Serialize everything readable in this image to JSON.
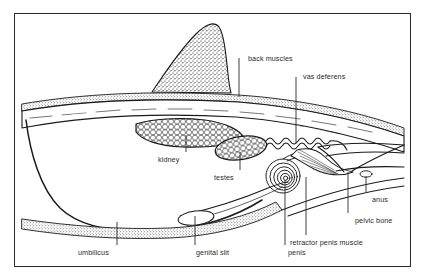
{
  "figure": {
    "background_color": "#ffffff",
    "frame_color": "#2b2b2b",
    "ink_color": "#1a1a1a",
    "label_color": "#2a2a2a"
  },
  "labels": [
    {
      "id": "back-muscles",
      "text": "back muscles",
      "x": 248,
      "y": 55,
      "leader": {
        "x1": 239,
        "y1": 58,
        "x2": 239,
        "y2": 97
      }
    },
    {
      "id": "vas-deferens",
      "text": "vas deferens",
      "x": 303,
      "y": 73,
      "leader": {
        "x1": 296,
        "y1": 77,
        "x2": 296,
        "y2": 143
      }
    },
    {
      "id": "kidney",
      "text": "kidney",
      "x": 158,
      "y": 156,
      "leader": {
        "x1": 186,
        "y1": 135,
        "x2": 186,
        "y2": 152
      }
    },
    {
      "id": "testes",
      "text": "testes",
      "x": 214,
      "y": 174,
      "leader": {
        "x1": 240,
        "y1": 152,
        "x2": 240,
        "y2": 170
      }
    },
    {
      "id": "anus",
      "text": "anus",
      "x": 372,
      "y": 196,
      "leader": {
        "x1": 366,
        "y1": 176,
        "x2": 366,
        "y2": 192
      }
    },
    {
      "id": "pelvic-bone",
      "text": "pelvic bone",
      "x": 355,
      "y": 217,
      "leader": {
        "x1": 348,
        "y1": 172,
        "x2": 348,
        "y2": 213
      }
    },
    {
      "id": "umbilicus",
      "text": "umbilicus",
      "x": 78,
      "y": 249,
      "leader": {
        "x1": 117,
        "y1": 222,
        "x2": 117,
        "y2": 245
      }
    },
    {
      "id": "genital-slit",
      "text": "genital slit",
      "x": 196,
      "y": 249,
      "leader": {
        "x1": 195,
        "y1": 216,
        "x2": 195,
        "y2": 245
      }
    },
    {
      "id": "penis",
      "text": "penis",
      "x": 288,
      "y": 249,
      "leader": {
        "x1": 285,
        "y1": 180,
        "x2": 285,
        "y2": 245
      }
    },
    {
      "id": "retractor-penis-muscle",
      "text": "retractor penis muscle",
      "x": 290,
      "y": 239,
      "leader": {
        "x1": 306,
        "y1": 177,
        "x2": 306,
        "y2": 235
      }
    }
  ],
  "structures": [
    {
      "id": "dorsal-fin-hump",
      "name": "stippled dorsal hump"
    },
    {
      "id": "skin-band",
      "name": "stippled skin band"
    },
    {
      "id": "back-muscle-mass",
      "name": "striated back muscles"
    },
    {
      "id": "kidney-mass",
      "name": "lobulated kidney"
    },
    {
      "id": "testes-oval",
      "name": "cellular testes oval"
    },
    {
      "id": "vas-deferens-coil",
      "name": "wavy vas deferens duct"
    },
    {
      "id": "penis-spiral",
      "name": "sigmoid flexure spiral"
    },
    {
      "id": "retractor-muscle",
      "name": "retractor penis muscle bands"
    },
    {
      "id": "pelvic-bone-shape",
      "name": "pelvic bone wedge"
    },
    {
      "id": "belly-outline",
      "name": "ventral body wall curve"
    },
    {
      "id": "prepuce-sheath",
      "name": "prepuce and genital slit"
    }
  ]
}
